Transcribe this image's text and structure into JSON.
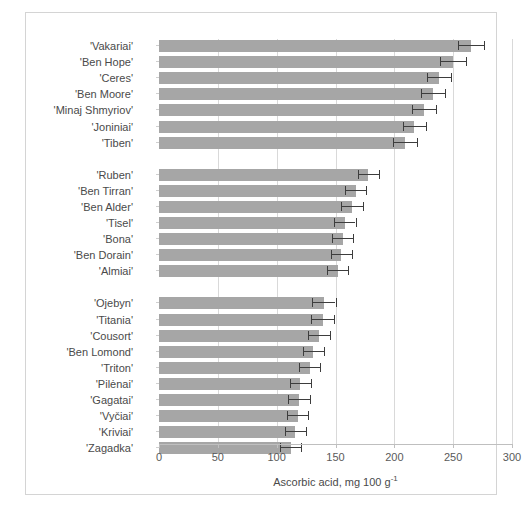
{
  "figure": {
    "background": "#ffffff",
    "frame_color": "#d4d4d4",
    "bar_color": "#a6a6a6",
    "error_color": "#3d3d3d",
    "grid_color": "#d9d9d9"
  },
  "chart_data": {
    "type": "bar",
    "orientation": "horizontal",
    "title": "",
    "xlabel": "Ascorbic acid, mg 100 g⁻¹",
    "xlabel_parts": {
      "text": "Ascorbic acid, mg 100 g",
      "superscript": "-1"
    },
    "ylabel": "",
    "xlim": [
      0,
      300
    ],
    "xticks": [
      0,
      50,
      100,
      150,
      200,
      250,
      300
    ],
    "xtick_labels": [
      "0",
      "50",
      "100",
      "150",
      "200",
      "250",
      "300"
    ],
    "grid": true,
    "grid_axis": "x",
    "legend": "none",
    "error_bars": "symmetric",
    "groups": [
      {
        "name": "group-1-high",
        "categories": [
          "'Vakariai'",
          "'Ben Hope'",
          "'Ceres'",
          "'Ben Moore'",
          "'Minaj Shmyriov'",
          "'Joniniai'",
          "'Tiben'"
        ],
        "values": [
          265,
          250,
          238,
          233,
          225,
          217,
          209
        ],
        "errors": [
          11,
          11,
          10,
          10,
          10,
          10,
          10
        ]
      },
      {
        "name": "group-2-medium",
        "categories": [
          "'Ruben'",
          "'Ben Tirran'",
          "'Ben Alder'",
          "'Tisel'",
          "'Bona'",
          "'Ben Dorain'",
          "'Almiai'"
        ],
        "values": [
          178,
          167,
          164,
          158,
          156,
          155,
          152
        ],
        "errors": [
          9,
          9,
          9,
          9,
          9,
          9,
          9
        ]
      },
      {
        "name": "group-3-low",
        "categories": [
          "'Ojebyn'",
          "'Titania'",
          "'Cousort'",
          "'Ben Lomond'",
          "'Triton'",
          "'Pilėnai'",
          "'Gagatai'",
          "'Vyčiai'",
          "'Kriviai'",
          "'Zagadka'"
        ],
        "values": [
          140,
          139,
          136,
          131,
          128,
          120,
          119,
          118,
          116,
          112
        ],
        "errors": [
          10,
          10,
          9,
          9,
          9,
          9,
          9,
          9,
          9,
          9
        ]
      }
    ]
  }
}
